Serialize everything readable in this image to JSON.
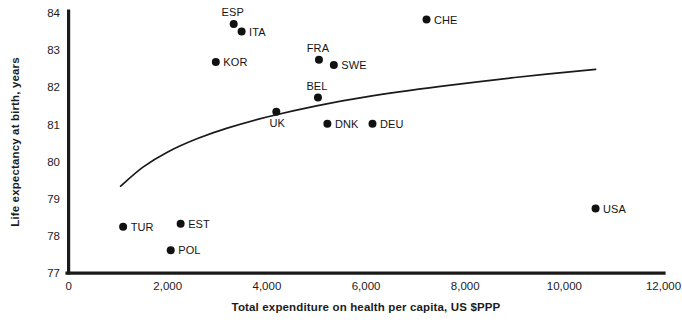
{
  "chart_data": {
    "type": "scatter",
    "title": "",
    "xlabel": "Total expenditure on health per capita, US $PPP",
    "ylabel": "Life expectancy at birth, years",
    "xlim": [
      0,
      12000
    ],
    "ylim": [
      77,
      84
    ],
    "xticks": [
      "0",
      "2,000",
      "4,000",
      "6,000",
      "8,000",
      "10,000",
      "12,000"
    ],
    "xtick_values": [
      0,
      2000,
      4000,
      6000,
      8000,
      10000,
      12000
    ],
    "yticks": [
      "77",
      "78",
      "79",
      "80",
      "81",
      "82",
      "83",
      "84"
    ],
    "ytick_values": [
      77,
      78,
      79,
      80,
      81,
      82,
      83,
      84
    ],
    "grid": false,
    "legend": "none",
    "points": [
      {
        "label": "TUR",
        "x": 1100,
        "y": 78.25,
        "label_pos": "right"
      },
      {
        "label": "EST",
        "x": 2260,
        "y": 78.33,
        "label_pos": "right"
      },
      {
        "label": "POL",
        "x": 2060,
        "y": 77.62,
        "label_pos": "right"
      },
      {
        "label": "KOR",
        "x": 2970,
        "y": 82.68,
        "label_pos": "right"
      },
      {
        "label": "ESP",
        "x": 3330,
        "y": 83.7,
        "label_pos": "above"
      },
      {
        "label": "ITA",
        "x": 3490,
        "y": 83.5,
        "label_pos": "right"
      },
      {
        "label": "FRA",
        "x": 5050,
        "y": 82.74,
        "label_pos": "above"
      },
      {
        "label": "SWE",
        "x": 5350,
        "y": 82.6,
        "label_pos": "right"
      },
      {
        "label": "BEL",
        "x": 5030,
        "y": 81.72,
        "label_pos": "above"
      },
      {
        "label": "UK",
        "x": 4190,
        "y": 81.34,
        "label_pos": "below"
      },
      {
        "label": "DNK",
        "x": 5220,
        "y": 81.02,
        "label_pos": "right"
      },
      {
        "label": "DEU",
        "x": 6130,
        "y": 81.02,
        "label_pos": "right"
      },
      {
        "label": "CHE",
        "x": 7220,
        "y": 83.82,
        "label_pos": "right"
      },
      {
        "label": "USA",
        "x": 10630,
        "y": 78.74,
        "label_pos": "right"
      }
    ],
    "trend_line": {
      "name": "fitted logarithmic trend",
      "points": [
        {
          "x": 1050,
          "y": 79.34
        },
        {
          "x": 1500,
          "y": 79.85
        },
        {
          "x": 2000,
          "y": 80.26
        },
        {
          "x": 2600,
          "y": 80.62
        },
        {
          "x": 3200,
          "y": 80.9
        },
        {
          "x": 4000,
          "y": 81.2
        },
        {
          "x": 5000,
          "y": 81.5
        },
        {
          "x": 6000,
          "y": 81.74
        },
        {
          "x": 7500,
          "y": 82.02
        },
        {
          "x": 9000,
          "y": 82.26
        },
        {
          "x": 10630,
          "y": 82.48
        }
      ]
    }
  },
  "axis": {
    "x_title": "Total expenditure on health per capita, US $PPP",
    "y_title": "Life expectancy at birth, years"
  }
}
